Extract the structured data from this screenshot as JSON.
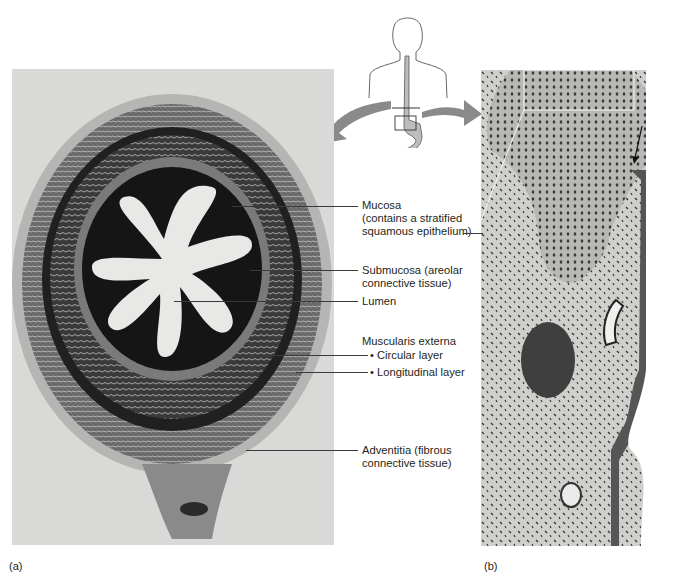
{
  "figure": {
    "panel_a_tag": "(a)",
    "panel_b_tag": "(b)",
    "labels": [
      {
        "id": "mucosa",
        "lines": [
          "Mucosa",
          "(contains a stratified",
          "squamous epithelium)"
        ]
      },
      {
        "id": "submucosa",
        "lines": [
          "Submucosa (areolar",
          "connective tissue)"
        ]
      },
      {
        "id": "lumen",
        "lines": [
          "Lumen"
        ]
      },
      {
        "id": "muscularis",
        "lines": [
          "Muscularis externa"
        ]
      },
      {
        "id": "circular",
        "lines": [
          "• Circular layer"
        ]
      },
      {
        "id": "longitudinal",
        "lines": [
          "• Longitudinal layer"
        ]
      },
      {
        "id": "adventitia",
        "lines": [
          "Adventitia (fibrous",
          "connective tissue)"
        ]
      }
    ],
    "colors": {
      "panel_a_bg": "#d9d9d7",
      "panel_b_bg": "#cfcfcc",
      "arrow_gray": "#8a8a8a",
      "tissue_dark": "#1c1c1c",
      "esophagus_fill": "#bdbdbd"
    }
  }
}
